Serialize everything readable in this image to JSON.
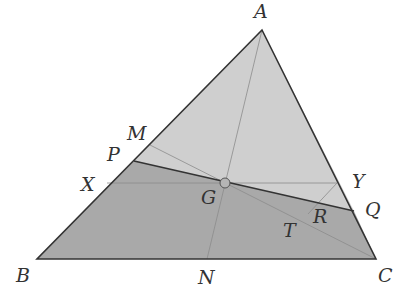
{
  "diagram": {
    "colors": {
      "upper_fill": "#cfcfcf",
      "lower_fill": "#a9a9a9",
      "edge": "#333333",
      "aux": "#8c8c8c",
      "point_fill": "#b5b5b5"
    },
    "labels": {
      "A": "A",
      "B": "B",
      "C": "C",
      "M": "M",
      "P": "P",
      "X": "X",
      "G": "G",
      "N": "N",
      "Y": "Y",
      "Q": "Q",
      "R": "R",
      "T": "T"
    }
  }
}
